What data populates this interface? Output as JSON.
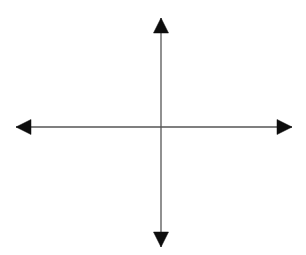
{
  "figure": {
    "title": "",
    "kind": "coordinate-axes-diagram",
    "width": 306,
    "height": 255,
    "background_color": "#ffffff",
    "axis_line_color": "#555555",
    "arrowhead_color": "#0d0d0d",
    "axis_line_width": 1.3,
    "origin": {
      "x": 161,
      "y": 127
    },
    "labels": {
      "x_axis_label": "",
      "y_axis_label": "",
      "origin_label": ""
    },
    "axes": [
      {
        "name": "horizontal-axis",
        "orientation": "horizontal",
        "from": {
          "x": 16,
          "y": 127
        },
        "to": {
          "x": 292,
          "y": 127
        },
        "arrow_start": true,
        "arrow_end": true
      },
      {
        "name": "vertical-axis",
        "orientation": "vertical",
        "from": {
          "x": 161,
          "y": 18
        },
        "to": {
          "x": 161,
          "y": 247
        },
        "arrow_start": true,
        "arrow_end": true
      }
    ],
    "arrowheads": [
      {
        "name": "arrowhead-up",
        "direction": "up",
        "tip": {
          "x": 161,
          "y": 18
        },
        "length": 15,
        "half_width": 7.5,
        "points": "161,18 153.5,33 168.5,33"
      },
      {
        "name": "arrowhead-down",
        "direction": "down",
        "tip": {
          "x": 161,
          "y": 247
        },
        "length": 15,
        "half_width": 7.5,
        "points": "161,247 153.5,232 168.5,232"
      },
      {
        "name": "arrowhead-left",
        "direction": "left",
        "tip": {
          "x": 16,
          "y": 127
        },
        "length": 15,
        "half_width": 7.5,
        "points": "16,127 31,119.5 31,134.5"
      },
      {
        "name": "arrowhead-right",
        "direction": "right",
        "tip": {
          "x": 292,
          "y": 127
        },
        "length": 15,
        "half_width": 7.5,
        "points": "292,127 277,119.5 277,134.5"
      }
    ],
    "ticks": [],
    "gridlines": [],
    "annotations": []
  },
  "chart_data": {
    "type": "scatter",
    "title": "",
    "xlabel": "",
    "ylabel": "",
    "xlim": [
      -1,
      1
    ],
    "ylim": [
      -1,
      1
    ],
    "grid": false,
    "legend": null,
    "series": [],
    "categories": [],
    "values": []
  }
}
